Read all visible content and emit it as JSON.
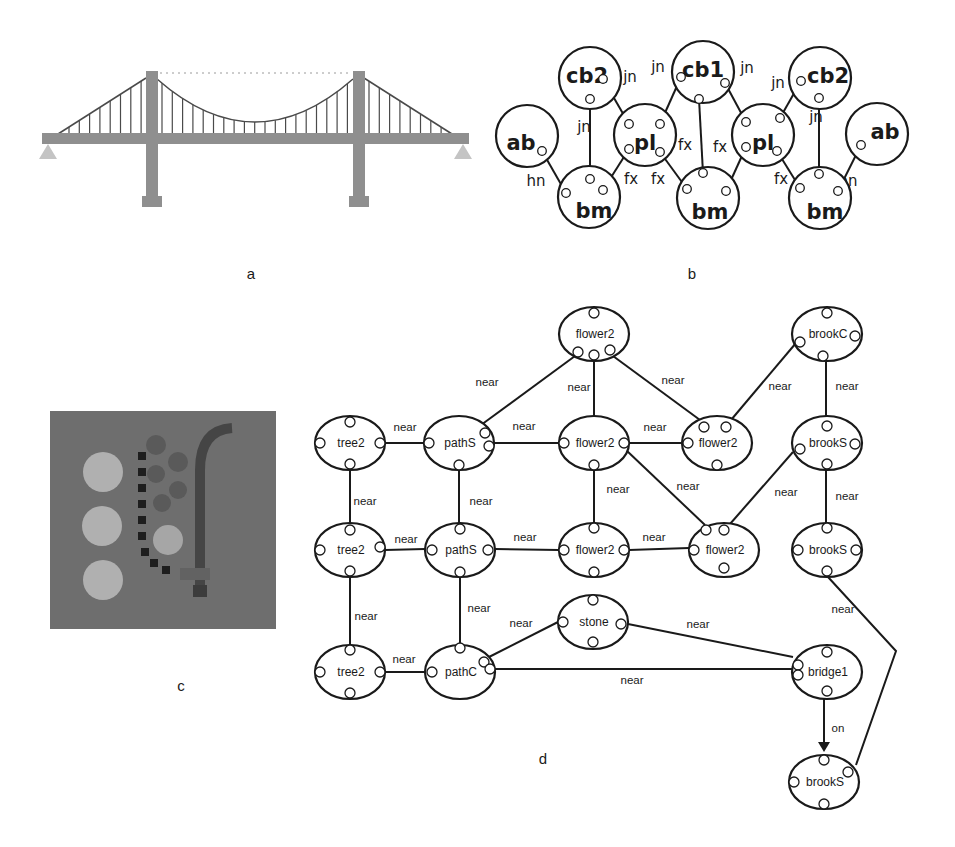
{
  "captions": {
    "a": "a",
    "b": "b",
    "c": "c",
    "d": "d"
  },
  "colors": {
    "bridge": "#8f8f8f",
    "bridge_support": "#c4c4c4",
    "cable": "#4a4a4a",
    "scene_bg": "#6e6e6e",
    "scene_stone": "#b0b0b0",
    "scene_path": "#1e1e1e",
    "scene_flower": "#5a5a5a",
    "scene_brook": "#454545",
    "line": "#1a1a1a"
  },
  "panel_a": {
    "name": "suspension-bridge-illustration",
    "hanger_count": 36
  },
  "panel_b": {
    "nodes": [
      {
        "id": "ab_l",
        "label": "ab"
      },
      {
        "id": "cb2_l",
        "label": "cb2"
      },
      {
        "id": "bm_l",
        "label": "bm"
      },
      {
        "id": "pl_l",
        "label": "pl"
      },
      {
        "id": "cb1",
        "label": "cb1"
      },
      {
        "id": "bm_m",
        "label": "bm"
      },
      {
        "id": "pl_r",
        "label": "pl"
      },
      {
        "id": "cb2_r",
        "label": "cb2"
      },
      {
        "id": "bm_r",
        "label": "bm"
      },
      {
        "id": "ab_r",
        "label": "ab"
      }
    ],
    "edges": [
      {
        "from": "ab_l",
        "to": "bm_l",
        "label": "hn"
      },
      {
        "from": "cb2_l",
        "to": "bm_l",
        "label": "jn"
      },
      {
        "from": "cb2_l",
        "to": "pl_l",
        "label": "jn"
      },
      {
        "from": "pl_l",
        "to": "bm_l",
        "label": "fx"
      },
      {
        "from": "pl_l",
        "to": "bm_m",
        "label": "fx"
      },
      {
        "from": "cb1",
        "to": "pl_l",
        "label": "jn"
      },
      {
        "from": "cb1",
        "to": "bm_m",
        "label": "fx"
      },
      {
        "from": "cb1",
        "to": "pl_r",
        "label": "jn"
      },
      {
        "from": "pl_r",
        "to": "bm_m",
        "label": "fx"
      },
      {
        "from": "cb2_r",
        "to": "pl_r",
        "label": "jn"
      },
      {
        "from": "pl_r",
        "to": "bm_r",
        "label": "fx"
      },
      {
        "from": "cb2_r",
        "to": "bm_r",
        "label": "jn"
      },
      {
        "from": "ab_r",
        "to": "bm_r",
        "label": "hn"
      }
    ]
  },
  "panel_c": {
    "name": "park-scene-render",
    "elements": [
      "tree2",
      "tree2",
      "tree2",
      "pathS",
      "pathC",
      "flower2",
      "stone",
      "brookS",
      "brookC",
      "bridge1"
    ]
  },
  "panel_d": {
    "nodes": [
      {
        "id": "flower2_top",
        "label": "flower2"
      },
      {
        "id": "brookC",
        "label": "brookC"
      },
      {
        "id": "tree2_1",
        "label": "tree2"
      },
      {
        "id": "pathS_1",
        "label": "pathS"
      },
      {
        "id": "flower2_1",
        "label": "flower2"
      },
      {
        "id": "flower2_1r",
        "label": "flower2"
      },
      {
        "id": "brookS_1",
        "label": "brookS"
      },
      {
        "id": "tree2_2",
        "label": "tree2"
      },
      {
        "id": "pathS_2",
        "label": "pathS"
      },
      {
        "id": "flower2_2",
        "label": "flower2"
      },
      {
        "id": "flower2_2r",
        "label": "flower2"
      },
      {
        "id": "brookS_2",
        "label": "brookS"
      },
      {
        "id": "stone",
        "label": "stone"
      },
      {
        "id": "tree2_3",
        "label": "tree2"
      },
      {
        "id": "pathC",
        "label": "pathC"
      },
      {
        "id": "bridge1",
        "label": "bridge1"
      },
      {
        "id": "brookS_3",
        "label": "brookS"
      }
    ],
    "edges": [
      {
        "from": "pathS_1",
        "to": "flower2_top",
        "label": "near"
      },
      {
        "from": "flower2_top",
        "to": "flower2_1",
        "label": "near"
      },
      {
        "from": "flower2_top",
        "to": "flower2_1r",
        "label": "near"
      },
      {
        "from": "brookC",
        "to": "flower2_1r",
        "label": "near"
      },
      {
        "from": "brookC",
        "to": "brookS_1",
        "label": "near"
      },
      {
        "from": "tree2_1",
        "to": "pathS_1",
        "label": "near"
      },
      {
        "from": "pathS_1",
        "to": "flower2_1",
        "label": "near"
      },
      {
        "from": "flower2_1",
        "to": "flower2_1r",
        "label": "near"
      },
      {
        "from": "flower2_1",
        "to": "flower2_2r",
        "label": "near"
      },
      {
        "from": "brookS_1",
        "to": "flower2_2r",
        "label": "near"
      },
      {
        "from": "brookS_1",
        "to": "brookS_2",
        "label": "near"
      },
      {
        "from": "tree2_1",
        "to": "tree2_2",
        "label": "near"
      },
      {
        "from": "pathS_1",
        "to": "pathS_2",
        "label": "near"
      },
      {
        "from": "flower2_1",
        "to": "flower2_2",
        "label": "near"
      },
      {
        "from": "tree2_2",
        "to": "pathS_2",
        "label": "near"
      },
      {
        "from": "pathS_2",
        "to": "flower2_2",
        "label": "near"
      },
      {
        "from": "flower2_2",
        "to": "flower2_2r",
        "label": "near"
      },
      {
        "from": "tree2_2",
        "to": "tree2_3",
        "label": "near"
      },
      {
        "from": "pathS_2",
        "to": "pathC",
        "label": "near"
      },
      {
        "from": "pathC",
        "to": "stone",
        "label": "near"
      },
      {
        "from": "stone",
        "to": "bridge1",
        "label": "near"
      },
      {
        "from": "tree2_3",
        "to": "pathC",
        "label": "near"
      },
      {
        "from": "pathC",
        "to": "bridge1",
        "label": "near"
      },
      {
        "from": "brookS_2",
        "to": "brookS_3",
        "label": "near"
      },
      {
        "from": "bridge1",
        "to": "brookS_3",
        "label": "on",
        "directed": true
      }
    ]
  }
}
